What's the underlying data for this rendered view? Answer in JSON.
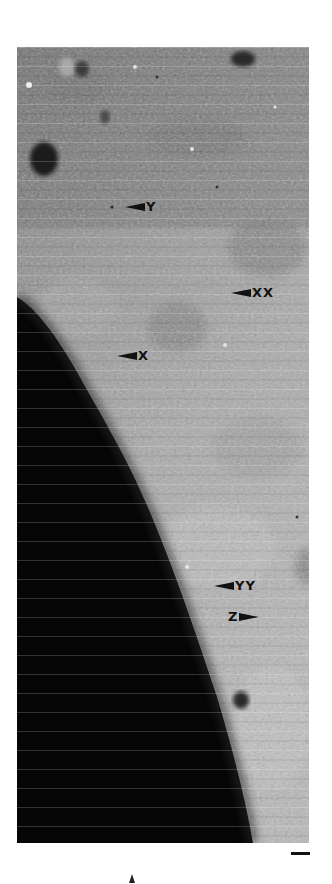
{
  "figure": {
    "colors": {
      "background": "#ffffff",
      "surface_mid": "#8e8e8e",
      "surface_light": "#b4b4b4",
      "shadow": "#050505",
      "annotation": "#111111"
    },
    "annotations": [
      {
        "id": "Y",
        "text": "Y",
        "arrow": "left",
        "x": 125,
        "y": 206
      },
      {
        "id": "XX",
        "text": "XX",
        "arrow": "left",
        "x": 231,
        "y": 292
      },
      {
        "id": "X",
        "text": "X",
        "arrow": "left",
        "x": 117,
        "y": 355
      },
      {
        "id": "YY",
        "text": "YY",
        "arrow": "left",
        "x": 214,
        "y": 585
      },
      {
        "id": "Z",
        "text": "Z",
        "arrow": "right",
        "x": 228,
        "y": 616
      }
    ],
    "scale_bar": {
      "visible": true
    },
    "north_arrow": {
      "visible": true
    }
  }
}
